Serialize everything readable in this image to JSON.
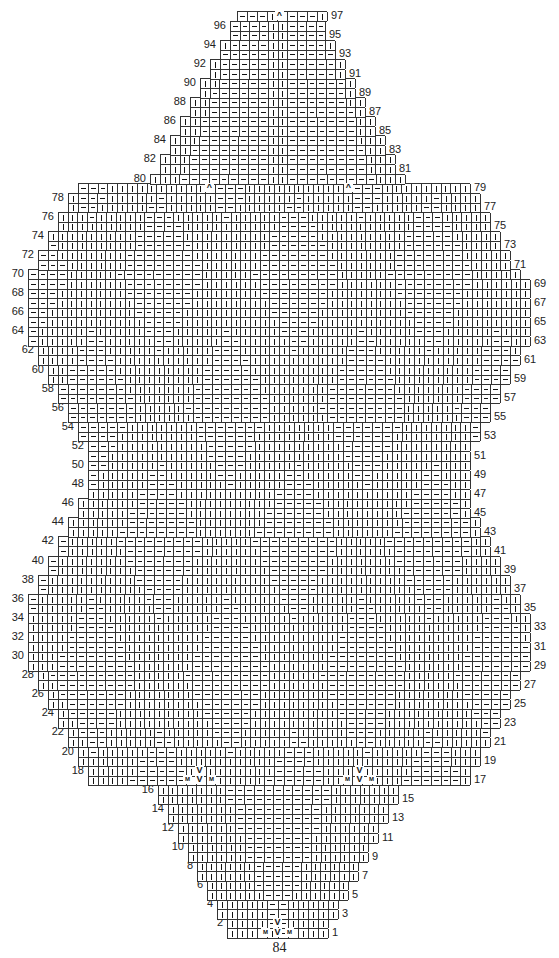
{
  "chart": {
    "type": "knitting-chart",
    "rows_total": 97,
    "odd_rows_label_side": "right",
    "even_rows_label_side": "left",
    "symbols": {
      "knit": "|",
      "purl": "—",
      "make_one": "M",
      "decrease": "V",
      "center_double_decrease": "^"
    },
    "row_extents": [
      {
        "row": 1,
        "l": 227,
        "r": 328
      },
      {
        "row": 2,
        "l": 227,
        "r": 328
      },
      {
        "row": 3,
        "l": 217,
        "r": 338
      },
      {
        "row": 4,
        "l": 217,
        "r": 338
      },
      {
        "row": 5,
        "l": 207,
        "r": 348
      },
      {
        "row": 6,
        "l": 207,
        "r": 348
      },
      {
        "row": 7,
        "l": 197,
        "r": 358
      },
      {
        "row": 8,
        "l": 197,
        "r": 358
      },
      {
        "row": 9,
        "l": 188,
        "r": 368
      },
      {
        "row": 10,
        "l": 188,
        "r": 368
      },
      {
        "row": 11,
        "l": 178,
        "r": 378
      },
      {
        "row": 12,
        "l": 178,
        "r": 378
      },
      {
        "row": 13,
        "l": 168,
        "r": 388
      },
      {
        "row": 14,
        "l": 168,
        "r": 388
      },
      {
        "row": 15,
        "l": 158,
        "r": 398
      },
      {
        "row": 16,
        "l": 158,
        "r": 398
      },
      {
        "row": 17,
        "l": 88,
        "r": 470
      },
      {
        "row": 18,
        "l": 88,
        "r": 470
      },
      {
        "row": 19,
        "l": 78,
        "r": 480
      },
      {
        "row": 20,
        "l": 78,
        "r": 480
      },
      {
        "row": 21,
        "l": 68,
        "r": 490
      },
      {
        "row": 22,
        "l": 68,
        "r": 490
      },
      {
        "row": 23,
        "l": 58,
        "r": 500
      },
      {
        "row": 24,
        "l": 58,
        "r": 500
      },
      {
        "row": 25,
        "l": 48,
        "r": 510
      },
      {
        "row": 26,
        "l": 48,
        "r": 510
      },
      {
        "row": 27,
        "l": 38,
        "r": 520
      },
      {
        "row": 28,
        "l": 38,
        "r": 520
      },
      {
        "row": 29,
        "l": 28,
        "r": 530
      },
      {
        "row": 30,
        "l": 28,
        "r": 530
      },
      {
        "row": 31,
        "l": 28,
        "r": 530
      },
      {
        "row": 32,
        "l": 28,
        "r": 530
      },
      {
        "row": 33,
        "l": 28,
        "r": 530
      },
      {
        "row": 34,
        "l": 28,
        "r": 530
      },
      {
        "row": 35,
        "l": 28,
        "r": 520
      },
      {
        "row": 36,
        "l": 28,
        "r": 520
      },
      {
        "row": 37,
        "l": 38,
        "r": 510
      },
      {
        "row": 38,
        "l": 38,
        "r": 510
      },
      {
        "row": 39,
        "l": 48,
        "r": 500
      },
      {
        "row": 40,
        "l": 48,
        "r": 500
      },
      {
        "row": 41,
        "l": 58,
        "r": 490
      },
      {
        "row": 42,
        "l": 58,
        "r": 490
      },
      {
        "row": 43,
        "l": 68,
        "r": 480
      },
      {
        "row": 44,
        "l": 68,
        "r": 480
      },
      {
        "row": 45,
        "l": 78,
        "r": 470
      },
      {
        "row": 46,
        "l": 78,
        "r": 470
      },
      {
        "row": 47,
        "l": 88,
        "r": 470
      },
      {
        "row": 48,
        "l": 88,
        "r": 470
      },
      {
        "row": 49,
        "l": 88,
        "r": 470
      },
      {
        "row": 50,
        "l": 88,
        "r": 470
      },
      {
        "row": 51,
        "l": 88,
        "r": 470
      },
      {
        "row": 52,
        "l": 88,
        "r": 470
      },
      {
        "row": 53,
        "l": 78,
        "r": 480
      },
      {
        "row": 54,
        "l": 78,
        "r": 480
      },
      {
        "row": 55,
        "l": 68,
        "r": 490
      },
      {
        "row": 56,
        "l": 68,
        "r": 490
      },
      {
        "row": 57,
        "l": 58,
        "r": 500
      },
      {
        "row": 58,
        "l": 58,
        "r": 500
      },
      {
        "row": 59,
        "l": 48,
        "r": 510
      },
      {
        "row": 60,
        "l": 48,
        "r": 510
      },
      {
        "row": 61,
        "l": 38,
        "r": 520
      },
      {
        "row": 62,
        "l": 38,
        "r": 520
      },
      {
        "row": 63,
        "l": 28,
        "r": 530
      },
      {
        "row": 64,
        "l": 28,
        "r": 530
      },
      {
        "row": 65,
        "l": 28,
        "r": 530
      },
      {
        "row": 66,
        "l": 28,
        "r": 530
      },
      {
        "row": 67,
        "l": 28,
        "r": 530
      },
      {
        "row": 68,
        "l": 28,
        "r": 530
      },
      {
        "row": 69,
        "l": 28,
        "r": 530
      },
      {
        "row": 70,
        "l": 28,
        "r": 520
      },
      {
        "row": 71,
        "l": 38,
        "r": 510
      },
      {
        "row": 72,
        "l": 38,
        "r": 510
      },
      {
        "row": 73,
        "l": 48,
        "r": 500
      },
      {
        "row": 74,
        "l": 48,
        "r": 500
      },
      {
        "row": 75,
        "l": 58,
        "r": 490
      },
      {
        "row": 76,
        "l": 58,
        "r": 490
      },
      {
        "row": 77,
        "l": 68,
        "r": 480
      },
      {
        "row": 78,
        "l": 68,
        "r": 480
      },
      {
        "row": 79,
        "l": 78,
        "r": 470
      },
      {
        "row": 80,
        "l": 150,
        "r": 405
      },
      {
        "row": 81,
        "l": 160,
        "r": 395
      },
      {
        "row": 82,
        "l": 160,
        "r": 395
      },
      {
        "row": 83,
        "l": 170,
        "r": 385
      },
      {
        "row": 84,
        "l": 170,
        "r": 385
      },
      {
        "row": 85,
        "l": 180,
        "r": 375
      },
      {
        "row": 86,
        "l": 180,
        "r": 375
      },
      {
        "row": 87,
        "l": 190,
        "r": 365
      },
      {
        "row": 88,
        "l": 190,
        "r": 365
      },
      {
        "row": 89,
        "l": 200,
        "r": 355
      },
      {
        "row": 90,
        "l": 200,
        "r": 355
      },
      {
        "row": 91,
        "l": 210,
        "r": 345
      },
      {
        "row": 92,
        "l": 210,
        "r": 345
      },
      {
        "row": 93,
        "l": 220,
        "r": 335
      },
      {
        "row": 94,
        "l": 220,
        "r": 335
      },
      {
        "row": 95,
        "l": 230,
        "r": 325
      },
      {
        "row": 96,
        "l": 230,
        "r": 325
      },
      {
        "row": 97,
        "l": 237,
        "r": 327
      }
    ],
    "layout": {
      "row1_top": 928,
      "row_height": 9.55,
      "cell_width": 9.7
    },
    "special_marks": [
      {
        "row": 1,
        "x": 277,
        "text": "V",
        "note": "center decrease"
      },
      {
        "row": 1,
        "x": 265,
        "text": "M"
      },
      {
        "row": 1,
        "x": 289,
        "text": "M"
      },
      {
        "row": 2,
        "x": 277,
        "text": "V"
      },
      {
        "row": 17,
        "x": 199,
        "text": "V"
      },
      {
        "row": 17,
        "x": 187,
        "text": "M"
      },
      {
        "row": 17,
        "x": 211,
        "text": "M"
      },
      {
        "row": 18,
        "x": 199,
        "text": "V"
      },
      {
        "row": 17,
        "x": 359,
        "text": "V"
      },
      {
        "row": 17,
        "x": 347,
        "text": "M"
      },
      {
        "row": 17,
        "x": 371,
        "text": "M"
      },
      {
        "row": 18,
        "x": 359,
        "text": "V"
      },
      {
        "row": 79,
        "x": 209,
        "text": "^"
      },
      {
        "row": 79,
        "x": 348,
        "text": "^"
      },
      {
        "row": 97,
        "x": 279,
        "text": "^"
      }
    ],
    "purl_zones": [
      {
        "from": 1,
        "to": 16,
        "cx": 278,
        "half_width_start": 5,
        "half_width_growth": 10
      },
      {
        "from": 80,
        "to": 96,
        "cx": 278,
        "half_width_start": 85,
        "half_width_growth": -6
      }
    ]
  },
  "page_number": "84"
}
